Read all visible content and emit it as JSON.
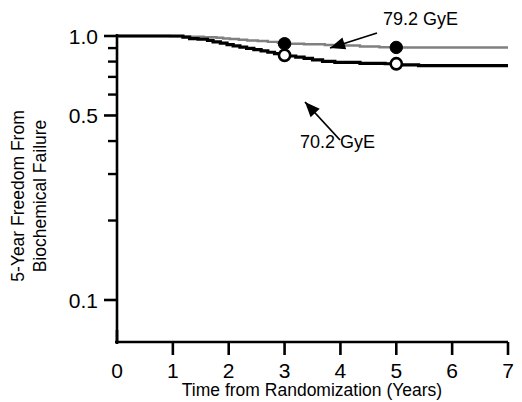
{
  "chart_data": {
    "type": "line",
    "title": "",
    "subtitle": "",
    "xlabel": "Time from Randomization (Years)",
    "ylabel": "5-Year Freedom From Biochemical Failure",
    "ylabel_line1": "5-Year Freedom From",
    "ylabel_line2": "Biochemical Failure",
    "yscale": "log",
    "xlim": [
      0,
      7
    ],
    "ylim": [
      0.1,
      1.0
    ],
    "grid": false,
    "legend_position": "inline-annotations",
    "xticks": [
      0,
      1,
      2,
      3,
      4,
      5,
      6,
      7
    ],
    "xtick_labels": [
      "0",
      "1",
      "2",
      "3",
      "4",
      "5",
      "6",
      "7"
    ],
    "yticks": [
      1.0,
      0.5,
      0.1
    ],
    "ytick_labels": [
      "1.0",
      "0.5",
      "0.1"
    ],
    "y_minor_ticks": [
      0.9,
      0.8,
      0.7,
      0.6,
      0.4,
      0.3,
      0.2
    ],
    "annotations": [
      {
        "text": "79.2 GyE",
        "series": "79.2 GyE",
        "arrow_from": [
          4.05,
          1.02
        ],
        "arrow_to": [
          3.05,
          0.955
        ]
      },
      {
        "text": "70.2 GyE",
        "series": "70.2 GyE",
        "arrow_from": [
          3.62,
          0.615
        ],
        "arrow_to": [
          3.05,
          0.79
        ]
      }
    ],
    "series": [
      {
        "name": "79.2 GyE",
        "color": "#808080",
        "linewidth": 2.4,
        "marker": "filled-circle",
        "marker_points": [
          {
            "x": 3.0,
            "y": 0.935,
            "label": "3-year estimate"
          },
          {
            "x": 5.0,
            "y": 0.905,
            "label": "5-year estimate"
          }
        ],
        "step_points": [
          [
            0.0,
            1.0
          ],
          [
            0.95,
            1.0
          ],
          [
            0.95,
            0.997
          ],
          [
            1.2,
            0.997
          ],
          [
            1.2,
            0.994
          ],
          [
            1.55,
            0.994
          ],
          [
            1.55,
            0.99
          ],
          [
            1.78,
            0.99
          ],
          [
            1.78,
            0.985
          ],
          [
            1.9,
            0.985
          ],
          [
            1.9,
            0.978
          ],
          [
            2.02,
            0.978
          ],
          [
            2.02,
            0.974
          ],
          [
            2.18,
            0.974
          ],
          [
            2.18,
            0.968
          ],
          [
            2.33,
            0.968
          ],
          [
            2.33,
            0.962
          ],
          [
            2.52,
            0.962
          ],
          [
            2.52,
            0.957
          ],
          [
            2.7,
            0.957
          ],
          [
            2.7,
            0.95
          ],
          [
            2.88,
            0.95
          ],
          [
            2.88,
            0.943
          ],
          [
            3.0,
            0.943
          ],
          [
            3.0,
            0.935
          ],
          [
            3.35,
            0.935
          ],
          [
            3.35,
            0.93
          ],
          [
            3.72,
            0.93
          ],
          [
            3.72,
            0.925
          ],
          [
            4.05,
            0.925
          ],
          [
            4.05,
            0.92
          ],
          [
            4.35,
            0.92
          ],
          [
            4.35,
            0.912
          ],
          [
            4.7,
            0.912
          ],
          [
            4.7,
            0.907
          ],
          [
            5.0,
            0.907
          ],
          [
            5.0,
            0.905
          ],
          [
            7.0,
            0.905
          ]
        ]
      },
      {
        "name": "70.2 GyE",
        "color": "#000000",
        "linewidth": 3.2,
        "marker": "open-circle",
        "marker_points": [
          {
            "x": 3.0,
            "y": 0.845,
            "label": "3-year estimate"
          },
          {
            "x": 5.0,
            "y": 0.785,
            "label": "5-year estimate"
          }
        ],
        "step_points": [
          [
            0.0,
            1.0
          ],
          [
            1.18,
            1.0
          ],
          [
            1.18,
            0.99
          ],
          [
            1.3,
            0.99
          ],
          [
            1.3,
            0.978
          ],
          [
            1.45,
            0.978
          ],
          [
            1.45,
            0.972
          ],
          [
            1.62,
            0.972
          ],
          [
            1.62,
            0.963
          ],
          [
            1.72,
            0.963
          ],
          [
            1.72,
            0.95
          ],
          [
            1.85,
            0.95
          ],
          [
            1.85,
            0.94
          ],
          [
            1.97,
            0.94
          ],
          [
            1.97,
            0.928
          ],
          [
            2.08,
            0.928
          ],
          [
            2.08,
            0.918
          ],
          [
            2.2,
            0.918
          ],
          [
            2.2,
            0.908
          ],
          [
            2.32,
            0.908
          ],
          [
            2.32,
            0.898
          ],
          [
            2.45,
            0.898
          ],
          [
            2.45,
            0.888
          ],
          [
            2.58,
            0.888
          ],
          [
            2.58,
            0.878
          ],
          [
            2.7,
            0.878
          ],
          [
            2.7,
            0.868
          ],
          [
            2.82,
            0.868
          ],
          [
            2.82,
            0.858
          ],
          [
            2.95,
            0.858
          ],
          [
            2.95,
            0.848
          ],
          [
            3.05,
            0.848
          ],
          [
            3.05,
            0.84
          ],
          [
            3.2,
            0.84
          ],
          [
            3.2,
            0.832
          ],
          [
            3.35,
            0.832
          ],
          [
            3.35,
            0.822
          ],
          [
            3.5,
            0.822
          ],
          [
            3.5,
            0.812
          ],
          [
            3.68,
            0.812
          ],
          [
            3.68,
            0.802
          ],
          [
            3.9,
            0.802
          ],
          [
            3.9,
            0.795
          ],
          [
            4.35,
            0.795
          ],
          [
            4.35,
            0.788
          ],
          [
            4.8,
            0.788
          ],
          [
            4.8,
            0.785
          ],
          [
            5.05,
            0.785
          ],
          [
            5.05,
            0.778
          ],
          [
            5.4,
            0.778
          ],
          [
            5.4,
            0.772
          ],
          [
            7.0,
            0.772
          ]
        ]
      }
    ]
  },
  "axis": {
    "x_title": "Time from Randomization (Years)",
    "y_title_line1": "5-Year Freedom From",
    "y_title_line2": "Biochemical Failure"
  }
}
